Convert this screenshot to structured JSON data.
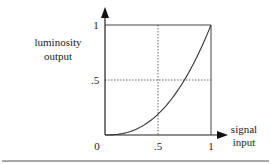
{
  "chart_data": {
    "type": "line",
    "title": "",
    "xlabel": "signal input",
    "ylabel": "luminosity output",
    "xlabel_lines": [
      "signal",
      "input"
    ],
    "ylabel_lines": [
      "luminosity",
      "output"
    ],
    "xlim": [
      0,
      1
    ],
    "ylim": [
      0,
      1
    ],
    "x_ticks": [
      "0",
      ".5",
      "1"
    ],
    "y_ticks": [
      ".5",
      "1"
    ],
    "grid": "dashed reference lines at x=0.5 and y=0.5",
    "series": [
      {
        "name": "gamma curve",
        "gamma": 2.4,
        "x": [
          0,
          0.1,
          0.2,
          0.3,
          0.4,
          0.5,
          0.6,
          0.7,
          0.8,
          0.9,
          1.0
        ],
        "values": [
          0,
          0.004,
          0.021,
          0.056,
          0.111,
          0.189,
          0.293,
          0.425,
          0.586,
          0.777,
          1.0
        ]
      }
    ],
    "colors": {
      "axis": "#222222",
      "curve": "#333333",
      "dashed": "#444444",
      "rule": "#555555"
    }
  }
}
